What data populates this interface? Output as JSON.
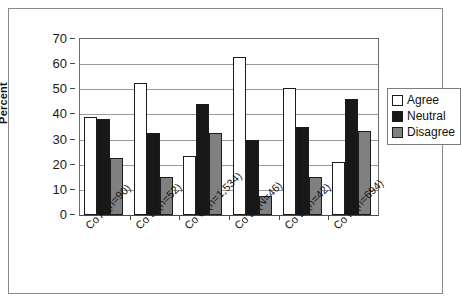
{
  "chart_data": {
    "type": "bar",
    "title": "",
    "xlabel": "",
    "ylabel": "Percent",
    "ylim": [
      0,
      70
    ],
    "yticks": [
      0,
      10,
      20,
      30,
      40,
      50,
      60,
      70
    ],
    "grid": true,
    "legend_position": "right",
    "categories": [
      "Co A (n=90)",
      "Co B (n=52)",
      "Co C (n=1,534)",
      "Co D (N=46)",
      "Co E (n=42)",
      "Co F (n=694)"
    ],
    "series": [
      {
        "name": "Agree",
        "color": "#ffffff",
        "values": [
          39,
          52.5,
          23.5,
          63,
          50.5,
          21
        ]
      },
      {
        "name": "Neutral",
        "color": "#181818",
        "values": [
          38,
          32.5,
          44,
          30,
          35,
          46
        ]
      },
      {
        "name": "Disagree",
        "color": "#808080",
        "values": [
          22.5,
          15,
          32.5,
          7.5,
          15,
          33.5
        ]
      }
    ]
  },
  "legend": {
    "items": [
      {
        "label": "Agree"
      },
      {
        "label": "Neutral"
      },
      {
        "label": "Disagree"
      }
    ]
  },
  "colors": {
    "agree": "#ffffff",
    "neutral": "#181818",
    "disagree": "#808080",
    "axis": "#4a4a4a",
    "grid": "#9a9a9a",
    "frame": "#8a8a8a"
  }
}
